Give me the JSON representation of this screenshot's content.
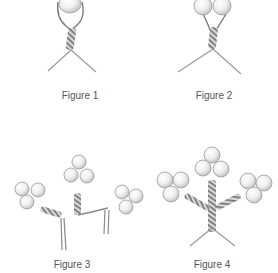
{
  "figures": [
    {
      "label": "Figure 1",
      "description": "single pearl on wire loop, twisted stem, splayed legs"
    },
    {
      "label": "Figure 2",
      "description": "two pearls on twisted stem, splayed legs"
    },
    {
      "label": "Figure 3",
      "description": "three four-pearl clusters joined by twisted branches"
    },
    {
      "label": "Figure 4",
      "description": "three pearl clusters on twisted branches forming a tree"
    }
  ],
  "colors": {
    "pearl_fill": "#f1f1f1",
    "pearl_shade": "#c8c8c8",
    "wire": "#8a8a8a",
    "wire_dark": "#5a5a5a",
    "caption": "#555555",
    "background": "#ffffff"
  }
}
